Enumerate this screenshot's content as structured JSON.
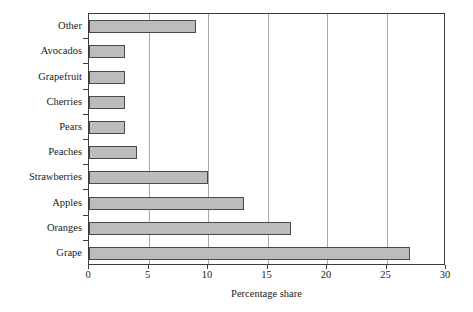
{
  "chart_data": {
    "type": "bar",
    "orientation": "horizontal",
    "title": "",
    "xlabel": "Percentage share",
    "ylabel": "",
    "categories": [
      "Other",
      "Avocados",
      "Grapefruit",
      "Cherries",
      "Pears",
      "Peaches",
      "Strawberries",
      "Apples",
      "Oranges",
      "Grape"
    ],
    "values": [
      9,
      3,
      3,
      3,
      3,
      4,
      10,
      13,
      17,
      27
    ],
    "xlim": [
      0,
      30
    ],
    "xticks": [
      0,
      5,
      10,
      15,
      20,
      25,
      30
    ],
    "xtick_labels": [
      "0",
      "5",
      "10",
      "15",
      "20",
      "25",
      "30"
    ],
    "grid": "vertical",
    "legend": "none",
    "bar_fill_color": "#bcbcbc",
    "bar_edge_color": "#4a4a4a",
    "gridline_color": "#a8a8a8",
    "frame_color": "#3c3c3c"
  }
}
